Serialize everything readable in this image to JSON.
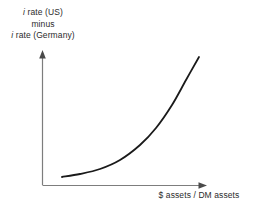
{
  "figure": {
    "name": "interest-rate-differential-vs-asset-ratio",
    "background_color": "#ffffff",
    "axis_color": "#7d7d7d",
    "curve_color": "#1a1a1a",
    "text_color": "#2b2b2b"
  },
  "y_axis": {
    "label_line_1_prefix": "i",
    "label_line_1_rest": " rate (US)",
    "label_line_2": "minus",
    "label_line_3_prefix": "i",
    "label_line_3_rest": " rate (Germany)",
    "label_full": "i rate (US) minus i rate (Germany)",
    "has_arrow": true,
    "arrow_direction": "up",
    "ticks": [],
    "tick_labels": []
  },
  "x_axis": {
    "label": "$ assets / DM assets",
    "has_arrow": true,
    "arrow_direction": "right",
    "ticks": [],
    "tick_labels": []
  },
  "chart_data": {
    "type": "line",
    "title": "",
    "subtitle": "",
    "xlabel": "$ assets / DM assets",
    "ylabel": "i rate (US) minus i rate (Germany)",
    "grid": false,
    "legend": false,
    "legend_position": "none",
    "axis_arrows": true,
    "tick_labels_x": [],
    "tick_labels_y": [],
    "xlim": [
      0,
      1
    ],
    "ylim": [
      0,
      1
    ],
    "annotations": [],
    "series": [
      {
        "name": "interest-differential-curve",
        "shape": "convex-increasing-exponential",
        "color": "#1a1a1a",
        "width_px": 1.8,
        "points_px": [
          [
            62,
            177
          ],
          [
            80,
            174
          ],
          [
            100,
            169
          ],
          [
            120,
            160
          ],
          [
            140,
            145
          ],
          [
            156,
            128
          ],
          [
            172,
            105
          ],
          [
            186,
            80
          ],
          [
            199,
            57
          ]
        ],
        "x_norm": [
          0.12,
          0.23,
          0.35,
          0.47,
          0.59,
          0.69,
          0.79,
          0.87,
          0.95
        ],
        "y_norm": [
          0.06,
          0.08,
          0.12,
          0.19,
          0.3,
          0.43,
          0.6,
          0.78,
          0.95
        ]
      }
    ]
  },
  "geometry": {
    "origin_px": [
      42,
      185
    ],
    "y_axis_top_px": 51,
    "x_axis_right_px": 207
  }
}
